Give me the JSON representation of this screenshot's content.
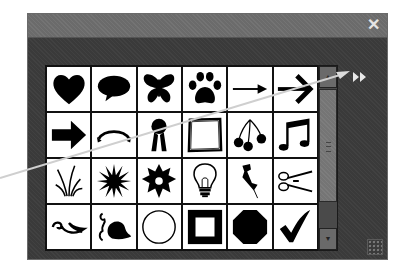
{
  "panel": {
    "title": "",
    "close_label": "✕",
    "colors": {
      "titlebar": "#6b6b6b",
      "body": "#3a3a3a",
      "grid_border": "#111111",
      "cell_bg": "#ffffff",
      "annotation_line": "#cfcfcf"
    }
  },
  "shapes": [
    {
      "icon": "heart-icon"
    },
    {
      "icon": "speech-bubble-icon"
    },
    {
      "icon": "butterfly-icon"
    },
    {
      "icon": "paw-print-icon"
    },
    {
      "icon": "thin-arrow-icon"
    },
    {
      "icon": "bold-arrow-icon"
    },
    {
      "icon": "block-arrow-icon"
    },
    {
      "icon": "banner-icon"
    },
    {
      "icon": "award-ribbon-icon"
    },
    {
      "icon": "rough-frame-icon"
    },
    {
      "icon": "cherries-icon"
    },
    {
      "icon": "music-note-icon"
    },
    {
      "icon": "grass-icon"
    },
    {
      "icon": "starburst-icon"
    },
    {
      "icon": "snowflake-icon"
    },
    {
      "icon": "light-bulb-icon"
    },
    {
      "icon": "push-pin-icon"
    },
    {
      "icon": "scissors-icon"
    },
    {
      "icon": "ornament-icon"
    },
    {
      "icon": "floral-ornament-icon"
    },
    {
      "icon": "circle-outline-icon"
    },
    {
      "icon": "square-frame-icon"
    },
    {
      "icon": "octagon-icon"
    },
    {
      "icon": "checkmark-icon"
    }
  ],
  "scrollbar": {
    "up_label": "▲",
    "down_label": "▼"
  },
  "flyout": {
    "icon": "double-triangle-icon"
  }
}
